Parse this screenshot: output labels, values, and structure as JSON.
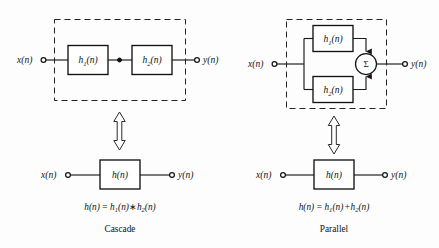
{
  "figure": {
    "background_color": "#fdfdfd",
    "ink_color": "#141414"
  },
  "cascade": {
    "caption": "Cascade",
    "equation": {
      "lhs": "h",
      "lhs_arg": "(n)",
      "equals": "=",
      "term1": "h",
      "term1_sub": "1",
      "term1_arg": "(n)",
      "operator": "∗",
      "term2": "h",
      "term2_sub": "2",
      "term2_arg": "(n)",
      "full_text": "h(n) = h1(n) * h2(n)"
    },
    "top_diagram": {
      "input_label": "x(n)",
      "output_label": "y(n)",
      "blocks": [
        {
          "name": "h",
          "sub": "1",
          "arg": "(n)",
          "full": "h1(n)"
        },
        {
          "name": "h",
          "sub": "2",
          "arg": "(n)",
          "full": "h2(n)"
        }
      ],
      "grouping": "dashed-box",
      "junction_dot": true
    },
    "bottom_diagram": {
      "input_label": "x(n)",
      "output_label": "y(n)",
      "block": {
        "name": "h",
        "sub": "",
        "arg": "(n)",
        "full": "h(n)"
      }
    },
    "equivalence_symbol": "double-headed-vertical-arrow"
  },
  "parallel": {
    "caption": "Parallel",
    "equation": {
      "lhs": "h",
      "lhs_arg": "(n)",
      "equals": "=",
      "term1": "h",
      "term1_sub": "1",
      "term1_arg": "(n)",
      "operator": "+",
      "term2": "h",
      "term2_sub": "2",
      "term2_arg": "(n)",
      "full_text": "h(n) = h1(n) + h2(n)"
    },
    "top_diagram": {
      "input_label": "x(n)",
      "output_label": "y(n)",
      "blocks": [
        {
          "name": "h",
          "sub": "1",
          "arg": "(n)",
          "full": "h1(n)"
        },
        {
          "name": "h",
          "sub": "2",
          "arg": "(n)",
          "full": "h2(n)"
        }
      ],
      "adder": {
        "glyph": "Σ",
        "name": "summing-junction"
      },
      "grouping": "dashed-box"
    },
    "bottom_diagram": {
      "input_label": "x(n)",
      "output_label": "y(n)",
      "block": {
        "name": "h",
        "sub": "",
        "arg": "(n)",
        "full": "h(n)"
      }
    },
    "equivalence_symbol": "double-headed-vertical-arrow"
  }
}
